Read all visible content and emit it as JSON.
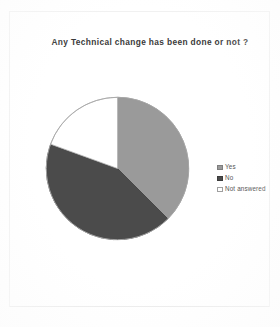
{
  "chart_frame": {
    "name": "chart-container"
  },
  "chart_data": {
    "type": "pie",
    "title": "Any Technical change has been done or not ?",
    "xlabel": "",
    "ylabel": "",
    "grid": false,
    "legend_position": "right",
    "start_angle_deg": 0,
    "direction": "clockwise",
    "categories": [
      "Yes",
      "No",
      "Not answered"
    ],
    "values": [
      37.5,
      43.0,
      19.5
    ],
    "value_unit": "percent",
    "slices": [
      {
        "label": "Yes",
        "value": 37.5,
        "start_deg": 0,
        "end_deg": 135,
        "color": "#9a9a9a",
        "edge_color": "#8d8d8d"
      },
      {
        "label": "No",
        "value": 43.0,
        "start_deg": 135,
        "end_deg": 290,
        "color": "#4b4b4b",
        "edge_color": "#3f3f3f"
      },
      {
        "label": "Not answered",
        "value": 19.5,
        "start_deg": 290,
        "end_deg": 360,
        "color": "#ffffff",
        "edge_color": "#b4b4b4"
      }
    ]
  },
  "legend": {
    "items": [
      {
        "label": "Yes",
        "color": "#9a9a9a",
        "border": "#7e7e7e"
      },
      {
        "label": "No",
        "color": "#4b4b4b",
        "border": "#3c3c3c"
      },
      {
        "label": "Not answered",
        "color": "#ffffff",
        "border": "#9f9f9f"
      }
    ]
  },
  "colors": {
    "background": "#ffffff",
    "title_text": "#3a3a3a",
    "legend_text": "#555555",
    "frame_border": "#f1f1f1"
  }
}
